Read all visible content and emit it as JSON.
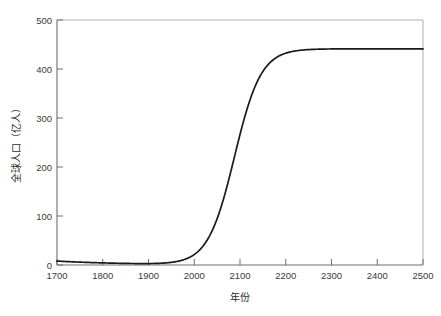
{
  "figure": {
    "background_color": "#ffffff",
    "width": 441,
    "height": 316
  },
  "axes": {
    "x_title": "年份",
    "y_title": "全球人口（亿人）",
    "x_tick_labels": [
      "1700",
      "1800",
      "1900",
      "2000",
      "2100",
      "2200",
      "2300",
      "2400",
      "2500"
    ],
    "y_tick_labels": [
      "0",
      "100",
      "200",
      "300",
      "400",
      "500"
    ],
    "spine_color": "#6e6e6e",
    "spine_color_light": "#b4b4b4",
    "tick_direction": "in",
    "line_color": "#1a1a1a"
  },
  "chart_data": {
    "type": "line",
    "title": "",
    "xlabel": "年份",
    "ylabel": "全球人口（亿人）",
    "xlim": [
      1700,
      2500
    ],
    "ylim": [
      0,
      500
    ],
    "xticks": [
      1700,
      1800,
      1900,
      2000,
      2100,
      2200,
      2300,
      2400,
      2500
    ],
    "yticks": [
      0,
      100,
      200,
      300,
      400,
      500
    ],
    "grid": false,
    "legend": null,
    "annotations": [],
    "series": [
      {
        "name": "全球人口",
        "color": "#1a1a1a",
        "linewidth": 1.7,
        "model": "logistic",
        "model_params": {
          "carrying_capacity": 441,
          "midpoint_year": 2088,
          "growth_rate": 0.0345,
          "value_at_1700": 8
        },
        "x": [
          1700,
          1725,
          1750,
          1775,
          1800,
          1825,
          1850,
          1875,
          1900,
          1925,
          1950,
          1960,
          1970,
          1980,
          1990,
          2000,
          2010,
          2020,
          2030,
          2040,
          2050,
          2060,
          2070,
          2080,
          2090,
          2100,
          2110,
          2120,
          2130,
          2140,
          2150,
          2160,
          2170,
          2180,
          2190,
          2200,
          2225,
          2250,
          2275,
          2300,
          2350,
          2400,
          2450,
          2500
        ],
        "y": [
          8,
          8.5,
          9,
          9.6,
          10.5,
          11.5,
          13,
          15,
          17.5,
          21,
          28,
          31,
          35,
          40,
          46,
          53,
          63,
          77,
          96,
          120,
          150,
          185,
          222,
          260,
          295,
          325,
          352,
          375,
          392,
          405,
          415,
          422,
          427,
          431,
          433,
          435,
          437,
          438,
          439,
          439.5,
          440,
          440.5,
          440.8,
          441
        ]
      }
    ]
  }
}
